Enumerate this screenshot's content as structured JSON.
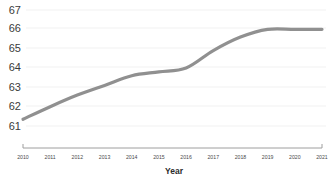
{
  "chart_data": {
    "type": "line",
    "title": "",
    "subtitle": "",
    "xlabel": "Year",
    "ylabel": "",
    "x": [
      2010,
      2011,
      2012,
      2013,
      2014,
      2015,
      2016,
      2017,
      2018,
      2019,
      2020,
      2021
    ],
    "categories": [
      "2010",
      "2011",
      "2012",
      "2013",
      "2014",
      "2015",
      "2016",
      "2017",
      "2018",
      "2019",
      "2020",
      "2021"
    ],
    "values": [
      61.35,
      62.0,
      62.6,
      63.1,
      63.6,
      63.8,
      64.0,
      64.9,
      65.6,
      66.0,
      66.0,
      66.0
    ],
    "series": [
      {
        "name": "",
        "color": "#909090",
        "values": [
          61.35,
          62.0,
          62.6,
          63.1,
          63.6,
          63.8,
          64.0,
          64.9,
          65.6,
          66.0,
          66.0,
          66.0
        ]
      }
    ],
    "xlim": [
      2010,
      2021
    ],
    "ylim": [
      61,
      67
    ],
    "yticks": [
      61,
      62,
      63,
      64,
      65,
      66,
      67
    ],
    "ytick_labels": [
      "61",
      "62",
      "63",
      "64",
      "65",
      "66",
      "67"
    ],
    "xtick_labels": [
      "2010",
      "2011",
      "2012",
      "2013",
      "2014",
      "2015",
      "2016",
      "2017",
      "2018",
      "2019",
      "2020",
      "2021"
    ],
    "grid": true,
    "grid_axis": "y",
    "legend": false,
    "legend_position": "none",
    "line_color": "#909090",
    "gridline_color": "#f1f1f1",
    "axis_color": "#9e9e9e"
  },
  "axes": {
    "y_labels": [
      "67",
      "66",
      "65",
      "64",
      "63",
      "62",
      "61"
    ],
    "x_labels": [
      "2010",
      "2011",
      "2012",
      "2013",
      "2014",
      "2015",
      "2016",
      "2017",
      "2018",
      "2019",
      "2020",
      "2021"
    ],
    "x_axis_title": "Year"
  }
}
